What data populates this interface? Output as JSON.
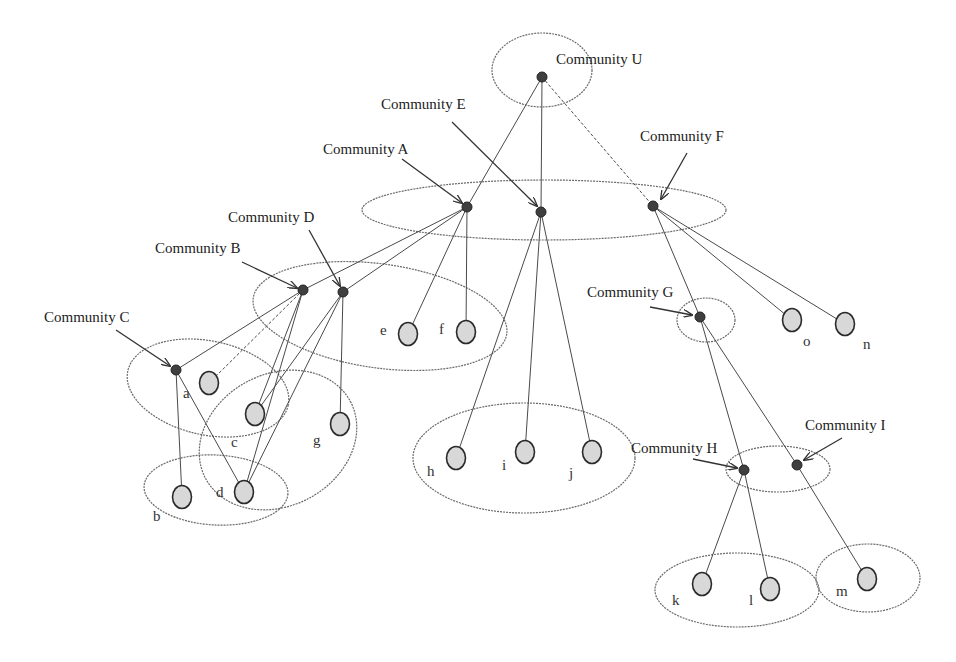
{
  "diagram": {
    "title": "",
    "communities": [
      {
        "id": "U",
        "label": "Community U",
        "x": 542,
        "y": 77,
        "label_x": 556,
        "label_y": 64
      },
      {
        "id": "E",
        "label": "Community E",
        "x": 541,
        "y": 212,
        "label_x": 381,
        "label_y": 109
      },
      {
        "id": "A",
        "label": "Community A",
        "x": 467,
        "y": 207,
        "label_x": 323,
        "label_y": 154
      },
      {
        "id": "F",
        "label": "Community F",
        "x": 653,
        "y": 206,
        "label_x": 640,
        "label_y": 141
      },
      {
        "id": "D",
        "label": "Community  D",
        "x": 343,
        "y": 292,
        "label_x": 228,
        "label_y": 222
      },
      {
        "id": "B",
        "label": "Community B",
        "x": 303,
        "y": 290,
        "label_x": 155,
        "label_y": 253
      },
      {
        "id": "C",
        "label": "Community C",
        "x": 176,
        "y": 370,
        "label_x": 44,
        "label_y": 322
      },
      {
        "id": "G",
        "label": "Community G",
        "x": 700,
        "y": 317,
        "label_x": 587,
        "label_y": 297
      },
      {
        "id": "H",
        "label": "Community H",
        "x": 744,
        "y": 470,
        "label_x": 631,
        "label_y": 453
      },
      {
        "id": "I",
        "label": "Community I",
        "x": 797,
        "y": 465,
        "label_x": 805,
        "label_y": 430
      }
    ],
    "leaves": [
      {
        "id": "a",
        "label": "a",
        "x": 209,
        "y": 383,
        "label_x": 183,
        "label_y": 398
      },
      {
        "id": "c",
        "label": "c",
        "x": 255,
        "y": 414,
        "label_x": 231,
        "label_y": 447
      },
      {
        "id": "g",
        "label": "g",
        "x": 340,
        "y": 424,
        "label_x": 313,
        "label_y": 445
      },
      {
        "id": "b",
        "label": "b",
        "x": 182,
        "y": 497,
        "label_x": 153,
        "label_y": 521
      },
      {
        "id": "d",
        "label": "d",
        "x": 244,
        "y": 492,
        "label_x": 216,
        "label_y": 497
      },
      {
        "id": "e",
        "label": "e",
        "x": 408,
        "y": 334,
        "label_x": 380,
        "label_y": 335
      },
      {
        "id": "f",
        "label": "f",
        "x": 466,
        "y": 332,
        "label_x": 439,
        "label_y": 334
      },
      {
        "id": "h",
        "label": "h",
        "x": 456,
        "y": 458,
        "label_x": 427,
        "label_y": 476
      },
      {
        "id": "i",
        "label": "i",
        "x": 525,
        "y": 452,
        "label_x": 502,
        "label_y": 470
      },
      {
        "id": "j",
        "label": "j",
        "x": 592,
        "y": 452,
        "label_x": 569,
        "label_y": 478
      },
      {
        "id": "o",
        "label": "o",
        "x": 792,
        "y": 320,
        "label_x": 803,
        "label_y": 346
      },
      {
        "id": "n",
        "label": "n",
        "x": 845,
        "y": 324,
        "label_x": 863,
        "label_y": 349
      },
      {
        "id": "k",
        "label": "k",
        "x": 702,
        "y": 584,
        "label_x": 672,
        "label_y": 605
      },
      {
        "id": "l",
        "label": "l",
        "x": 770,
        "y": 589,
        "label_x": 749,
        "label_y": 605
      },
      {
        "id": "m",
        "label": "m",
        "x": 867,
        "y": 579,
        "label_x": 836,
        "label_y": 596
      }
    ],
    "edges": [
      {
        "from": "U",
        "to": "A"
      },
      {
        "from": "U",
        "to": "E"
      },
      {
        "from": "U",
        "to": "F",
        "style": "dashed"
      },
      {
        "from": "A",
        "to": "B"
      },
      {
        "from": "A",
        "to": "D"
      },
      {
        "from": "A",
        "to": "e"
      },
      {
        "from": "A",
        "to": "f"
      },
      {
        "from": "E",
        "to": "h"
      },
      {
        "from": "E",
        "to": "i"
      },
      {
        "from": "E",
        "to": "j"
      },
      {
        "from": "F",
        "to": "G"
      },
      {
        "from": "F",
        "to": "o"
      },
      {
        "from": "F",
        "to": "n"
      },
      {
        "from": "B",
        "to": "C"
      },
      {
        "from": "B",
        "to": "a",
        "style": "dashed"
      },
      {
        "from": "B",
        "to": "c"
      },
      {
        "from": "B",
        "to": "d"
      },
      {
        "from": "D",
        "to": "c"
      },
      {
        "from": "D",
        "to": "d"
      },
      {
        "from": "D",
        "to": "g"
      },
      {
        "from": "C",
        "to": "b"
      },
      {
        "from": "C",
        "to": "d"
      },
      {
        "from": "G",
        "to": "H"
      },
      {
        "from": "G",
        "to": "I"
      },
      {
        "from": "H",
        "to": "k"
      },
      {
        "from": "H",
        "to": "l"
      },
      {
        "from": "I",
        "to": "m"
      }
    ],
    "groupings": [
      {
        "name": "U",
        "cx": 542,
        "cy": 70,
        "rx": 50,
        "ry": 37,
        "rotate": 0
      },
      {
        "name": "A-E-F",
        "cx": 544,
        "cy": 210,
        "rx": 182,
        "ry": 30,
        "rotate": 0
      },
      {
        "name": "B-D-e-f",
        "cx": 380,
        "cy": 316,
        "rx": 128,
        "ry": 52,
        "rotate": 8
      },
      {
        "name": "C-a-c",
        "cx": 208,
        "cy": 388,
        "rx": 82,
        "ry": 47,
        "rotate": 12
      },
      {
        "name": "c-g-d",
        "cx": 278,
        "cy": 440,
        "rx": 82,
        "ry": 66,
        "rotate": -28
      },
      {
        "name": "b-d",
        "cx": 216,
        "cy": 490,
        "rx": 72,
        "ry": 35,
        "rotate": 3
      },
      {
        "name": "h-i-j",
        "cx": 524,
        "cy": 458,
        "rx": 111,
        "ry": 55,
        "rotate": 0
      },
      {
        "name": "G",
        "cx": 706,
        "cy": 320,
        "rx": 29,
        "ry": 22,
        "rotate": 0
      },
      {
        "name": "H-I",
        "cx": 778,
        "cy": 469,
        "rx": 52,
        "ry": 23,
        "rotate": 0
      },
      {
        "name": "k-l",
        "cx": 737,
        "cy": 590,
        "rx": 82,
        "ry": 37,
        "rotate": 0
      },
      {
        "name": "m",
        "cx": 868,
        "cy": 578,
        "rx": 52,
        "ry": 34,
        "rotate": 0
      }
    ],
    "arrows": [
      {
        "for": "E",
        "x1": 452,
        "y1": 122,
        "x2": 537,
        "y2": 206
      },
      {
        "for": "A",
        "x1": 402,
        "y1": 159,
        "x2": 462,
        "y2": 203
      },
      {
        "for": "F",
        "x1": 687,
        "y1": 153,
        "x2": 661,
        "y2": 199
      },
      {
        "for": "D",
        "x1": 309,
        "y1": 230,
        "x2": 340,
        "y2": 286
      },
      {
        "for": "B",
        "x1": 242,
        "y1": 262,
        "x2": 297,
        "y2": 288
      },
      {
        "for": "C",
        "x1": 116,
        "y1": 330,
        "x2": 170,
        "y2": 366
      },
      {
        "for": "G",
        "x1": 650,
        "y1": 307,
        "x2": 692,
        "y2": 315
      },
      {
        "for": "H",
        "x1": 693,
        "y1": 459,
        "x2": 737,
        "y2": 468
      },
      {
        "for": "I",
        "x1": 842,
        "y1": 438,
        "x2": 804,
        "y2": 460
      }
    ]
  }
}
